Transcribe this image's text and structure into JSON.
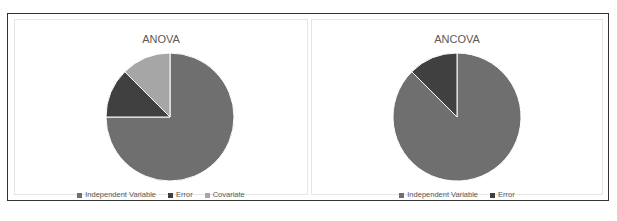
{
  "chart_data": [
    {
      "type": "pie",
      "title": "ANOVA",
      "categories": [
        "Independent Variable",
        "Error",
        "Covariate"
      ],
      "values": [
        75,
        12.5,
        12.5
      ],
      "colors": [
        "#6f6f6f",
        "#404040",
        "#a6a6a6"
      ],
      "legend_position": "bottom"
    },
    {
      "type": "pie",
      "title": "ANCOVA",
      "categories": [
        "Independent Variable",
        "Error"
      ],
      "values": [
        87.5,
        12.5
      ],
      "colors": [
        "#6f6f6f",
        "#404040"
      ],
      "legend_position": "bottom"
    }
  ],
  "anova": {
    "title": "ANOVA",
    "legend": [
      {
        "label": "Independent Variable",
        "color": "#6f6f6f"
      },
      {
        "label": "Error",
        "color": "#404040"
      },
      {
        "label": "Covariate",
        "color": "#a6a6a6"
      }
    ]
  },
  "ancova": {
    "title": "ANCOVA",
    "legend": [
      {
        "label": "Independent Variable",
        "color": "#6f6f6f"
      },
      {
        "label": "Error",
        "color": "#404040"
      }
    ]
  }
}
